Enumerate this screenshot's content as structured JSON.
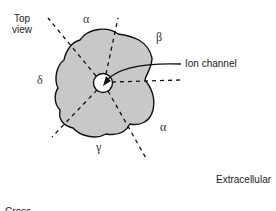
{
  "figure": {
    "view_label_line1": "Top",
    "view_label_line2": "view",
    "subunits": {
      "alpha_top": "α",
      "beta": "β",
      "delta": "δ",
      "alpha_bottom": "α",
      "gamma": "γ"
    },
    "ion_channel_label": "Ion channel",
    "extracellular_label": "Extracellular",
    "cross_label_partial": "Cross",
    "colors": {
      "protein_fill": "#c8c8c8",
      "outline": "#111111",
      "pore_fill": "#ffffff"
    }
  }
}
